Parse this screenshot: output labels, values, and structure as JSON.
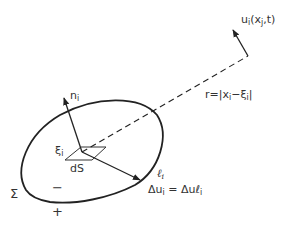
{
  "diagram": {
    "labels": {
      "normal": {
        "base": "n",
        "sub": "i"
      },
      "source_point": {
        "base": "ξ",
        "sub": "i"
      },
      "area_element": "dS",
      "slip_dir": {
        "base": "ℓ",
        "sub": "i"
      },
      "slip_eq_lhs": "Δu",
      "slip_eq_lhs_sub": "i",
      "slip_eq_rhs": " = Δuℓ",
      "slip_eq_rhs_sub": "i",
      "surface": "Σ",
      "minus_side": "−",
      "plus_side": "+",
      "distance": "r=|x",
      "distance_sub1": "i",
      "distance_mid": "−ξ",
      "distance_sub2": "i",
      "distance_end": "|",
      "displacement": "u",
      "displacement_sub": "i",
      "displacement_args": "(x",
      "displacement_args_sub": "j",
      "displacement_args_end": ",t)"
    },
    "colors": {
      "stroke": "#222222",
      "background": "#ffffff"
    }
  }
}
